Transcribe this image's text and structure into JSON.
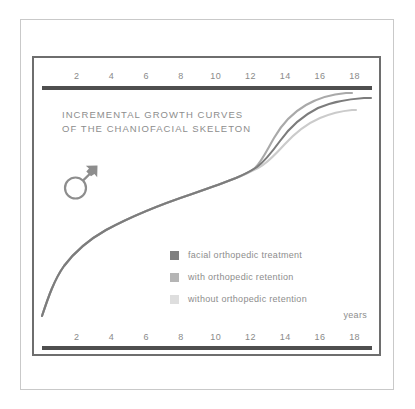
{
  "figure": {
    "title_line1": "INCREMENTAL GROWTH CURVES",
    "title_line2": "OF THE CHANIOFACIAL SKELETON",
    "sex_symbol_name": "male-mars-symbol",
    "axis_unit_label": "years"
  },
  "colors": {
    "frame": "#6e6e6e",
    "axis_bar": "#4f4f4f",
    "text": "#8d8d8d",
    "tick_text": "#8a8a8a",
    "page_border": "#c9c9c9",
    "series_treatment": "#808080",
    "series_with_retention": "#a8a8a8",
    "series_without_retention": "#cccccc"
  },
  "legend": {
    "items": [
      {
        "label": "facial orthopedic treatment",
        "color": "#808080"
      },
      {
        "label": "with orthopedic retention",
        "color": "#b5b5b5"
      },
      {
        "label": "without orthopedic retention",
        "color": "#dedede"
      }
    ]
  },
  "chart_data": {
    "type": "line",
    "title": "INCREMENTAL GROWTH CURVES OF THE CHANIOFACIAL SKELETON",
    "subtitle": "male",
    "xlabel": "years",
    "ylabel": "",
    "xlim": [
      0,
      19
    ],
    "ylim": [
      0,
      100
    ],
    "grid": false,
    "legend_position": "inside-lower-center",
    "tick_labels_top": [
      "2",
      "4",
      "6",
      "8",
      "10",
      "12",
      "14",
      "16",
      "18"
    ],
    "tick_labels_bottom": [
      "2",
      "4",
      "6",
      "8",
      "10",
      "12",
      "14",
      "16",
      "18"
    ],
    "tick_values": [
      2,
      4,
      6,
      8,
      10,
      12,
      14,
      16,
      18
    ],
    "x": [
      0.5,
      1,
      2,
      3,
      4,
      5,
      6,
      7,
      8,
      9,
      10,
      11,
      12,
      12.5,
      13,
      13.5,
      14,
      14.5,
      15,
      15.5,
      16,
      17,
      18,
      18.8
    ],
    "series": [
      {
        "name": "facial orthopedic treatment",
        "color": "#808080",
        "values": [
          2,
          12,
          26,
          34,
          40,
          45,
          49,
          53,
          56,
          59,
          62,
          65,
          68,
          70,
          74,
          79,
          84,
          88,
          91,
          93,
          94,
          95,
          95.5,
          95.5
        ]
      },
      {
        "name": "with orthopedic retention",
        "color": "#a8a8a8",
        "values": [
          2,
          12,
          26,
          34,
          40,
          45,
          49,
          53,
          56,
          59,
          62,
          65,
          68,
          72,
          79,
          86,
          92,
          96,
          98,
          99,
          99.5,
          99.5,
          99.5,
          99.5
        ]
      },
      {
        "name": "without orthopedic retention",
        "color": "#cccccc",
        "values": [
          2,
          12,
          26,
          34,
          40,
          45,
          49,
          53,
          56,
          59,
          62,
          65,
          68,
          69,
          71,
          74,
          78,
          82,
          85,
          87,
          88,
          89,
          89.5,
          89.5
        ]
      }
    ]
  }
}
